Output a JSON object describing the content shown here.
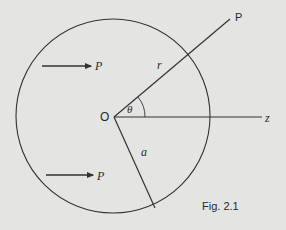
{
  "figure": {
    "caption": "Fig. 2.1",
    "origin_label": "O",
    "point_label": "P",
    "axis_label": "z",
    "radius_label": "r",
    "sphere_radius_label": "a",
    "angle_label": "θ",
    "force_labels": [
      "P",
      "P"
    ],
    "colors": {
      "background": "#e4e4e2",
      "line": "#333333"
    }
  }
}
